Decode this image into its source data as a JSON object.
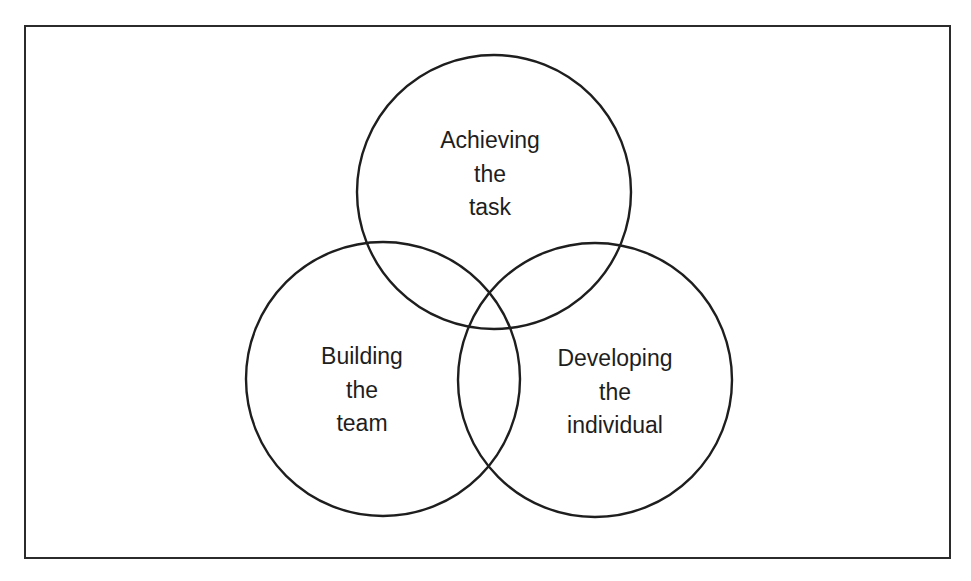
{
  "diagram": {
    "type": "venn",
    "stroke_color": "#1e1e1e",
    "background": "#ffffff",
    "circles": [
      {
        "id": "task",
        "lines": [
          "Achieving",
          "the",
          "task"
        ],
        "cx": 494,
        "cy": 192,
        "r": 137
      },
      {
        "id": "team",
        "lines": [
          "Building",
          "the",
          "team"
        ],
        "cx": 383,
        "cy": 379,
        "r": 137
      },
      {
        "id": "individual",
        "lines": [
          "Developing",
          "the",
          "individual"
        ],
        "cx": 595,
        "cy": 380,
        "r": 137
      }
    ]
  }
}
